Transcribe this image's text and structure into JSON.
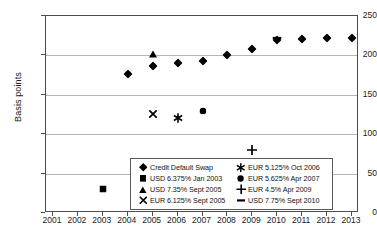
{
  "chart_data": {
    "type": "scatter",
    "title": "",
    "xlabel": "",
    "ylabel": "Basis points",
    "xlim": [
      2001,
      2013
    ],
    "ylim": [
      0,
      250
    ],
    "grid": true,
    "legend_position": "inside-bottom-center",
    "x_ticks": [
      "2001",
      "2002",
      "2003",
      "2004",
      "2005",
      "2006",
      "2007",
      "2008",
      "2009",
      "2010",
      "2011",
      "2012",
      "2013"
    ],
    "y_ticks": [
      "0",
      "50",
      "100",
      "150",
      "200",
      "250"
    ],
    "series": [
      {
        "name": "Credit Default Swap",
        "marker": "diamond",
        "points": [
          {
            "x": 2004,
            "y": 176
          },
          {
            "x": 2005,
            "y": 186
          },
          {
            "x": 2006,
            "y": 190
          },
          {
            "x": 2007,
            "y": 193
          },
          {
            "x": 2008,
            "y": 201
          },
          {
            "x": 2009,
            "y": 208
          },
          {
            "x": 2010,
            "y": 220
          },
          {
            "x": 2011,
            "y": 221
          },
          {
            "x": 2012,
            "y": 222
          },
          {
            "x": 2013,
            "y": 222
          }
        ]
      },
      {
        "name": "USD 6.375% Jan 2003",
        "marker": "square",
        "points": [
          {
            "x": 2003,
            "y": 30
          }
        ]
      },
      {
        "name": "USD 7.35% Sept 2005",
        "marker": "triangle",
        "points": [
          {
            "x": 2005,
            "y": 202
          }
        ]
      },
      {
        "name": "EUR 6.125% Sept 2005",
        "marker": "cross-x",
        "points": [
          {
            "x": 2005,
            "y": 126
          }
        ]
      },
      {
        "name": "EUR 5.125% Oct 2006",
        "marker": "asterisk",
        "points": [
          {
            "x": 2006,
            "y": 120
          }
        ]
      },
      {
        "name": "EUR 5.625% Apr 2007",
        "marker": "circle",
        "points": [
          {
            "x": 2007,
            "y": 130
          }
        ]
      },
      {
        "name": "EUR 4.5% Apr 2009",
        "marker": "plus",
        "points": [
          {
            "x": 2009,
            "y": 80
          }
        ]
      },
      {
        "name": "USD 7.75% Sept 2010",
        "marker": "dash",
        "points": [
          {
            "x": 2010,
            "y": 222
          }
        ]
      }
    ],
    "colors": {
      "marker": "#000000",
      "gridline": "#b5b5b5",
      "axis": "#4d4d4d",
      "background": "#ffffff",
      "text": "#1a1a1a"
    }
  }
}
